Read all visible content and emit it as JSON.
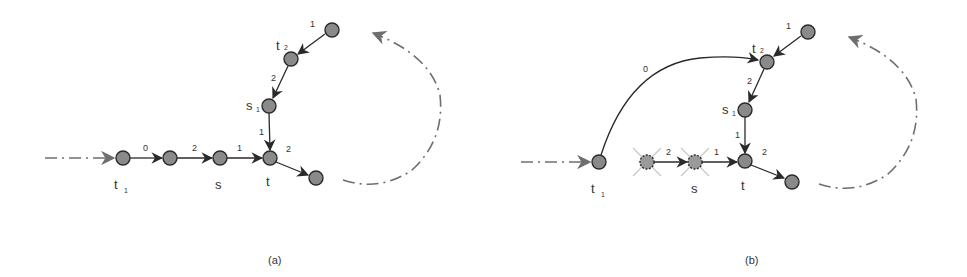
{
  "colors": {
    "node_fill": "#8a8a8a",
    "node_stroke": "#2a2a2a",
    "edge": "#2a2a2a",
    "dashed": "#6e6e6e",
    "cross": "#c8c8c8",
    "text": "#333333"
  },
  "panels": [
    {
      "caption": "(a)",
      "node_labels": {
        "t1": "t",
        "t1_sub": "1",
        "s": "s",
        "t": "t",
        "t2": "t",
        "t2_sub": "2",
        "s1": "s",
        "s1_sub": "1"
      },
      "edge_labels": [
        "0",
        "2",
        "1",
        "2",
        "1",
        "2",
        "1"
      ]
    },
    {
      "caption": "(b)",
      "node_labels": {
        "t1": "t",
        "t1_sub": "1",
        "s": "s",
        "t": "t",
        "t2": "t",
        "t2_sub": "2",
        "s1": "s",
        "s1_sub": "1"
      },
      "edge_labels": [
        "0",
        "2",
        "1",
        "2",
        "1",
        "2",
        "1"
      ],
      "crossed_nodes": 2
    }
  ]
}
